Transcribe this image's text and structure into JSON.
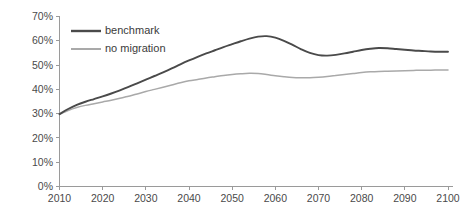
{
  "chart_data": {
    "type": "line",
    "title": "",
    "subtitle": "",
    "xlabel": "",
    "ylabel": "",
    "xlim": [
      2010,
      2100
    ],
    "ylim": [
      0,
      70
    ],
    "grid": false,
    "legend_position": "top-left-inside",
    "x_tick_labels": [
      "2010",
      "2020",
      "2030",
      "2040",
      "2050",
      "2060",
      "2070",
      "2080",
      "2090",
      "2100"
    ],
    "x_ticks": [
      2010,
      2020,
      2030,
      2040,
      2050,
      2060,
      2070,
      2080,
      2090,
      2100
    ],
    "y_tick_labels": [
      "0%",
      "10%",
      "20%",
      "30%",
      "40%",
      "50%",
      "60%",
      "70%"
    ],
    "y_ticks": [
      0,
      10,
      20,
      30,
      40,
      50,
      60,
      70
    ],
    "x": [
      2010,
      2012,
      2014,
      2016,
      2018,
      2020,
      2022,
      2024,
      2026,
      2028,
      2030,
      2032,
      2034,
      2036,
      2038,
      2040,
      2042,
      2044,
      2046,
      2048,
      2050,
      2052,
      2054,
      2056,
      2058,
      2060,
      2062,
      2064,
      2066,
      2068,
      2070,
      2072,
      2074,
      2076,
      2078,
      2080,
      2082,
      2084,
      2086,
      2088,
      2090,
      2092,
      2094,
      2096,
      2098,
      2100
    ],
    "series": [
      {
        "name": "benchmark",
        "color": "#4a4a4a",
        "values": [
          29.8,
          31.9,
          33.6,
          34.9,
          36.0,
          37.1,
          38.3,
          39.6,
          41.0,
          42.5,
          44.0,
          45.5,
          47.0,
          48.6,
          50.3,
          51.9,
          53.4,
          54.8,
          56.1,
          57.4,
          58.6,
          59.8,
          60.9,
          61.7,
          61.9,
          61.3,
          60.0,
          58.3,
          56.5,
          55.0,
          54.1,
          53.9,
          54.2,
          54.8,
          55.5,
          56.2,
          56.7,
          57.0,
          56.9,
          56.6,
          56.3,
          56.0,
          55.8,
          55.6,
          55.5,
          55.5
        ]
      },
      {
        "name": "no migration",
        "color": "#a9a9a9",
        "values": [
          29.8,
          31.3,
          32.5,
          33.4,
          34.1,
          34.8,
          35.5,
          36.3,
          37.2,
          38.1,
          39.1,
          40.0,
          40.9,
          41.8,
          42.7,
          43.5,
          44.1,
          44.7,
          45.2,
          45.7,
          46.1,
          46.4,
          46.6,
          46.5,
          46.1,
          45.6,
          45.2,
          44.9,
          44.8,
          44.8,
          45.0,
          45.3,
          45.7,
          46.1,
          46.5,
          46.9,
          47.2,
          47.4,
          47.5,
          47.6,
          47.7,
          47.8,
          47.9,
          47.9,
          48.0,
          48.0
        ]
      }
    ],
    "legend": [
      {
        "label": "benchmark",
        "color": "#4a4a4a"
      },
      {
        "label": "no migration",
        "color": "#a9a9a9"
      }
    ],
    "axis_color": "#9a9a9a",
    "background_color": "#ffffff"
  }
}
